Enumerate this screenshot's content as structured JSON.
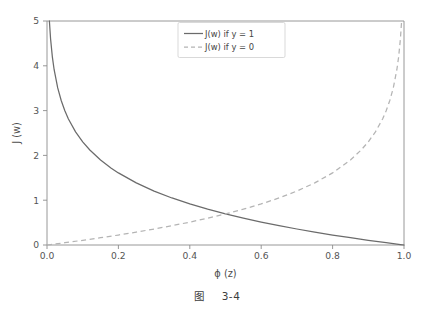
{
  "figure": {
    "caption_prefix": "图",
    "caption_number": "3-4",
    "background_color": "#ffffff"
  },
  "colors": {
    "solid_curve": "#6b6b6b",
    "dashed_curve": "#b4b4b4",
    "axis": "#8c8c8c",
    "text": "#4a4a4a",
    "legend_border": "#cfcfcf"
  },
  "chart_data": {
    "type": "line",
    "title": "",
    "subtitle": "",
    "xlabel": "ϕ (z)",
    "ylabel": "J (w)",
    "xlim": [
      0.0,
      1.0
    ],
    "ylim": [
      0.0,
      5.0
    ],
    "grid": false,
    "legend_position": "upper center",
    "xticks": [
      0.0,
      0.2,
      0.4,
      0.6,
      0.8,
      1.0
    ],
    "xticklabels": [
      "0.0",
      "0.2",
      "0.4",
      "0.6",
      "0.8",
      "1.0"
    ],
    "yticks": [
      0,
      1,
      2,
      3,
      4,
      5
    ],
    "yticklabels": [
      "0",
      "1",
      "2",
      "3",
      "4",
      "5"
    ],
    "annotations": [],
    "series": [
      {
        "name": "J(w) if y = 1",
        "style": "solid",
        "color": "#6b6b6b",
        "formula": "-log(ϕ(z))",
        "x": [
          0.0067,
          0.01,
          0.015,
          0.02,
          0.03,
          0.04,
          0.05,
          0.06,
          0.08,
          0.1,
          0.12,
          0.15,
          0.18,
          0.2,
          0.25,
          0.3,
          0.35,
          0.4,
          0.45,
          0.5,
          0.55,
          0.6,
          0.65,
          0.7,
          0.75,
          0.8,
          0.85,
          0.9,
          0.95,
          0.99,
          1.0
        ],
        "y": [
          5.0,
          4.605,
          4.2,
          3.912,
          3.507,
          3.219,
          2.996,
          2.813,
          2.526,
          2.303,
          2.12,
          1.897,
          1.715,
          1.609,
          1.386,
          1.204,
          1.05,
          0.916,
          0.799,
          0.693,
          0.598,
          0.511,
          0.431,
          0.357,
          0.288,
          0.223,
          0.163,
          0.105,
          0.051,
          0.01,
          0.0
        ]
      },
      {
        "name": "J(w) if y = 0",
        "style": "dashed",
        "color": "#b4b4b4",
        "formula": "-log(1 - ϕ(z))",
        "x": [
          0.0,
          0.01,
          0.05,
          0.1,
          0.15,
          0.2,
          0.25,
          0.3,
          0.35,
          0.4,
          0.45,
          0.5,
          0.55,
          0.6,
          0.65,
          0.7,
          0.75,
          0.8,
          0.85,
          0.88,
          0.9,
          0.92,
          0.94,
          0.95,
          0.96,
          0.97,
          0.98,
          0.985,
          0.99,
          0.9933
        ],
        "y": [
          0.0,
          0.01,
          0.051,
          0.105,
          0.163,
          0.223,
          0.288,
          0.357,
          0.431,
          0.511,
          0.598,
          0.693,
          0.799,
          0.916,
          1.05,
          1.204,
          1.386,
          1.609,
          1.897,
          2.12,
          2.303,
          2.526,
          2.813,
          2.996,
          3.219,
          3.507,
          3.912,
          4.2,
          4.605,
          5.0
        ]
      }
    ]
  },
  "legend": {
    "entries": [
      {
        "label": "J(w) if y = 1",
        "style": "solid"
      },
      {
        "label": "J(w) if y = 0",
        "style": "dashed"
      }
    ]
  },
  "axes": {
    "x_tick_labels": [
      "0.0",
      "0.2",
      "0.4",
      "0.6",
      "0.8",
      "1.0"
    ],
    "y_tick_labels": [
      "0",
      "1",
      "2",
      "3",
      "4",
      "5"
    ],
    "x_title": "ϕ (z)",
    "y_title": "J (w)"
  }
}
